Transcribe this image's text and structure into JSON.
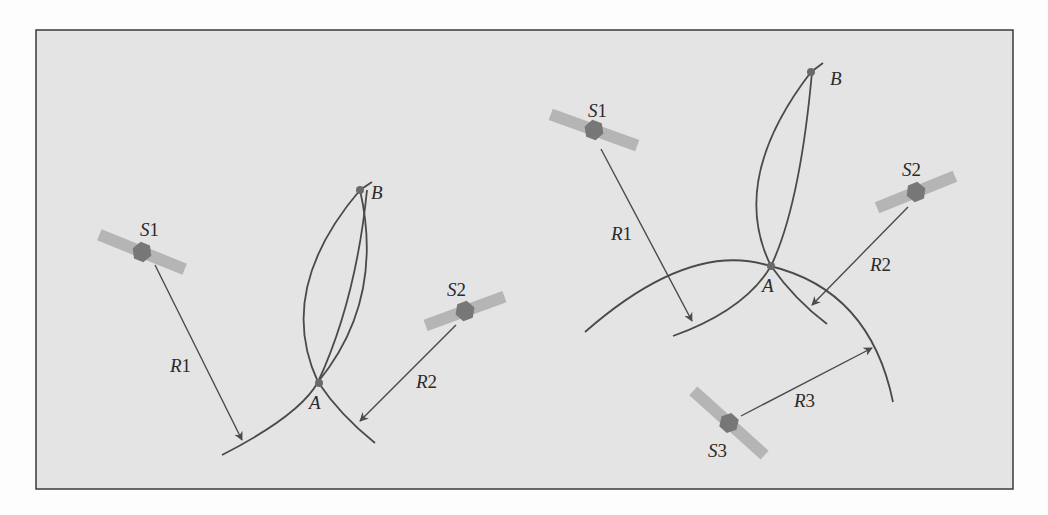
{
  "colors": {
    "page_background": "#fdfdfd",
    "frame_fill": "#e4e4e4",
    "frame_border": "#3a3a3a",
    "curve": "#4a4a4a",
    "satellite_body": "#777777",
    "satellite_panel": "#b5b5b5",
    "point_marker": "#6a6a6a",
    "label": "#2b2b2b"
  },
  "left_panel": {
    "satellites": [
      {
        "id": "S1",
        "letter": "S",
        "number": "1"
      },
      {
        "id": "S2",
        "letter": "S",
        "number": "2"
      }
    ],
    "ranges": [
      {
        "id": "R1",
        "letter": "R",
        "number": "1"
      },
      {
        "id": "R2",
        "letter": "R",
        "number": "2"
      }
    ],
    "points": [
      {
        "id": "A",
        "label": "A"
      },
      {
        "id": "B",
        "label": "B"
      }
    ]
  },
  "right_panel": {
    "satellites": [
      {
        "id": "S1",
        "letter": "S",
        "number": "1"
      },
      {
        "id": "S2",
        "letter": "S",
        "number": "2"
      },
      {
        "id": "S3",
        "letter": "S",
        "number": "3"
      }
    ],
    "ranges": [
      {
        "id": "R1",
        "letter": "R",
        "number": "1"
      },
      {
        "id": "R2",
        "letter": "R",
        "number": "2"
      },
      {
        "id": "R3",
        "letter": "R",
        "number": "3"
      }
    ],
    "points": [
      {
        "id": "A",
        "label": "A"
      },
      {
        "id": "B",
        "label": "B"
      }
    ]
  }
}
